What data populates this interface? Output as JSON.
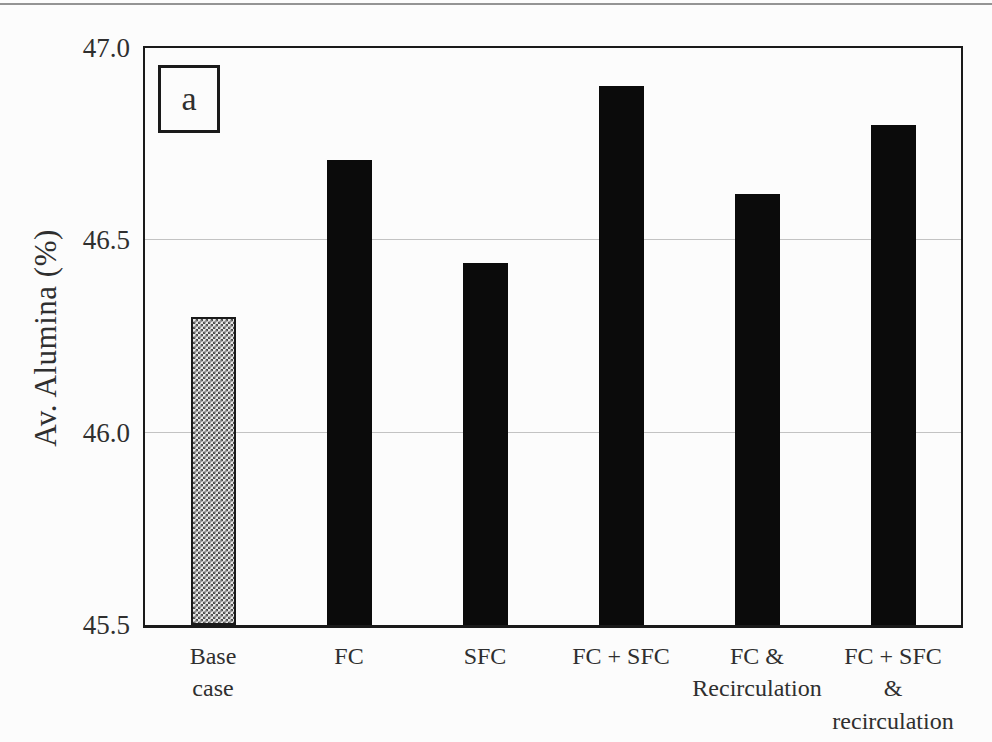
{
  "chart_data": {
    "type": "bar",
    "title": "",
    "panel_label": "a",
    "xlabel": "",
    "ylabel": "Av. Alumina (%)",
    "ylim": [
      45.5,
      47.0
    ],
    "yticks": [
      "45.5",
      "46.0",
      "46.5",
      "47.0"
    ],
    "grid": "horizontal gridlines at interior ticks (46.0, 46.5)",
    "legend": "none",
    "categories": [
      "Base\ncase",
      "FC",
      "SFC",
      "FC + SFC",
      "FC &\nRecirculation",
      "FC + SFC &\nrecirculation"
    ],
    "values": [
      46.3,
      46.71,
      46.44,
      46.9,
      46.62,
      46.8
    ],
    "bar_styles": [
      "hatched",
      "solid",
      "solid",
      "solid",
      "solid",
      "solid"
    ],
    "colors": {
      "paper": "#fcfcfc",
      "bar_solid": "#0b0b0b",
      "bar_hatch_fg": "#4d4d4d",
      "bar_hatch_bg": "#e6e6e6",
      "frame": "#1a1a1a",
      "gridline": "#c3c3c3",
      "text": "#2f2f2f",
      "top_rule": "#949494"
    }
  }
}
